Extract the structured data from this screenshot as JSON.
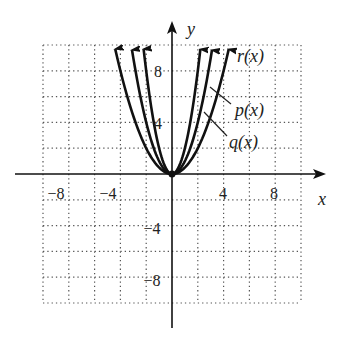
{
  "chart_data": {
    "type": "line",
    "title": "",
    "xlabel": "x",
    "ylabel": "y",
    "xlim": [
      -10,
      10
    ],
    "ylim": [
      -10,
      10
    ],
    "grid": true,
    "grid_step": 2,
    "x_ticks": [
      -8,
      -4,
      4,
      8
    ],
    "y_ticks": [
      8,
      4,
      -4,
      -8
    ],
    "x_tick_labels": [
      "−8",
      "−4",
      "4",
      "8"
    ],
    "y_tick_labels": [
      "8",
      "4",
      "−4",
      "−8"
    ],
    "series": [
      {
        "name": "r(x)",
        "formula": "2x^2",
        "coef": 2,
        "x_range": [
          -2.2,
          2.2
        ]
      },
      {
        "name": "p(x)",
        "formula": "x^2",
        "coef": 1,
        "x_range": [
          -3.1,
          3.1
        ]
      },
      {
        "name": "q(x)",
        "formula": "0.5x^2",
        "coef": 0.5,
        "x_range": [
          -4.4,
          4.4
        ]
      }
    ],
    "annotations": [
      {
        "text": "r(x)",
        "target": "r(x)"
      },
      {
        "text": "p(x)",
        "target": "p(x)"
      },
      {
        "text": "q(x)",
        "target": "q(x)"
      }
    ],
    "legend": "none (inline labels at right)"
  },
  "labels": {
    "x_axis": "x",
    "y_axis": "y",
    "r": "r(x)",
    "p": "p(x)",
    "q": "q(x)",
    "xt_m8": "−8",
    "xt_m4": "−4",
    "xt_4": "4",
    "xt_8": "8",
    "yt_8": "8",
    "yt_4": "4",
    "yt_m4": "−4",
    "yt_m8": "−8"
  }
}
